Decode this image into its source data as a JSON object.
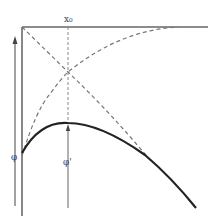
{
  "diagram": {
    "labels": {
      "x0": "x₀",
      "phi": "φ",
      "phi_prime": "φ'"
    },
    "colors": {
      "solid_curve": "#222222",
      "axis": "#555555",
      "dashed": "#777777",
      "text": "#444444"
    },
    "elements": [
      {
        "name": "top-horizontal-line",
        "style": "solid"
      },
      {
        "name": "left-vertical-axis",
        "style": "solid"
      },
      {
        "name": "left-up-arrow",
        "style": "solid-arrow"
      },
      {
        "name": "x0-dashed-vertical",
        "style": "dashed"
      },
      {
        "name": "phi-prime-arrow",
        "style": "solid-arrow"
      },
      {
        "name": "descending-dashed-diagonal",
        "style": "dashed"
      },
      {
        "name": "ascending-dashed-curve",
        "style": "dashed"
      },
      {
        "name": "phi-solid-curve",
        "style": "solid-thick"
      }
    ]
  }
}
